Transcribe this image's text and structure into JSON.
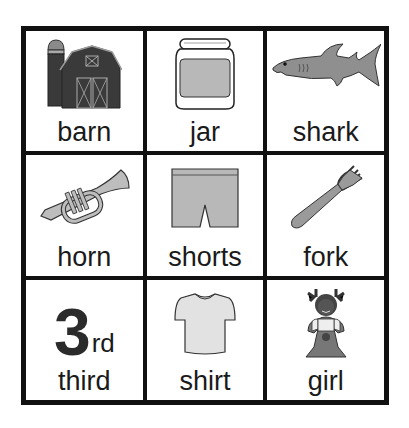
{
  "board": {
    "cells": [
      {
        "word": "barn",
        "icon": "barn-icon"
      },
      {
        "word": "jar",
        "icon": "jar-icon"
      },
      {
        "word": "shark",
        "icon": "shark-icon"
      },
      {
        "word": "horn",
        "icon": "trumpet-icon"
      },
      {
        "word": "shorts",
        "icon": "shorts-icon"
      },
      {
        "word": "fork",
        "icon": "fork-icon"
      },
      {
        "word": "third",
        "icon": "ordinal-3rd-icon",
        "ordinal_number": "3",
        "ordinal_suffix": "rd"
      },
      {
        "word": "shirt",
        "icon": "shirt-icon"
      },
      {
        "word": "girl",
        "icon": "girl-icon"
      }
    ]
  },
  "colors": {
    "border": "#111111",
    "dark_fill": "#3a3a3a",
    "mid_fill": "#9a9a9a",
    "light_fill": "#c8c8c8",
    "background": "#ffffff"
  }
}
